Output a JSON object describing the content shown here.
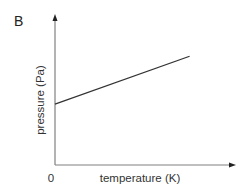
{
  "panel_label": "B",
  "chart_data": {
    "type": "line",
    "title": "",
    "xlabel": "temperature (K)",
    "ylabel": "pressure (Pa)",
    "x_tick_labels": [
      "0"
    ],
    "grid": false,
    "legend": null,
    "series": [
      {
        "name": "pressure vs temperature",
        "x": [
          0,
          1
        ],
        "y": [
          0.42,
          0.75
        ],
        "description": "straight line with positive slope and non-zero y-intercept"
      }
    ],
    "xlim": [
      0,
      1.3
    ],
    "ylim": [
      0,
      1.0
    ],
    "axis_arrows": true
  },
  "colors": {
    "axis": "#808080",
    "line": "#333333",
    "text": "#333333"
  }
}
